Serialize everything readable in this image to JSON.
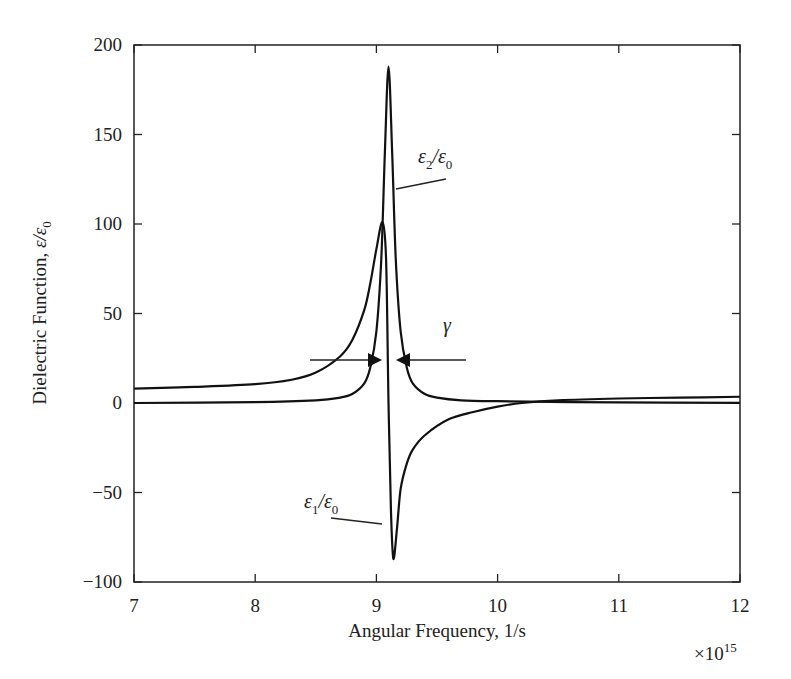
{
  "chart_data": {
    "type": "line",
    "title": "",
    "xlabel": "Angular Frequency, 1/s",
    "ylabel": "Dielectric Function, ε/ε0",
    "x_multiplier_label": "×10^15",
    "xlim": [
      7,
      12
    ],
    "ylim": [
      -100,
      200
    ],
    "xticks": [
      7,
      8,
      9,
      10,
      11,
      12
    ],
    "yticks": [
      -100,
      -50,
      0,
      50,
      100,
      150,
      200
    ],
    "ytick_labels": [
      "−100",
      "−50",
      "0",
      "50",
      "100",
      "150",
      "200"
    ],
    "grid": false,
    "legend": null,
    "series": [
      {
        "name": "ε1/ε0",
        "x": [
          7,
          7.5,
          8,
          8.3,
          8.5,
          8.7,
          8.8,
          8.9,
          8.95,
          9.0,
          9.05,
          9.08,
          9.1,
          9.12,
          9.14,
          9.17,
          9.2,
          9.25,
          9.3,
          9.4,
          9.6,
          9.8,
          10.0,
          10.2,
          10.5,
          11,
          11.5,
          12
        ],
        "y": [
          8,
          9,
          10.5,
          13,
          17,
          26,
          35,
          52,
          67,
          86,
          101,
          80,
          0,
          -60,
          -87,
          -70,
          -48,
          -34,
          -26,
          -18,
          -9,
          -5,
          -2,
          0,
          1.5,
          2.5,
          3,
          3.5
        ]
      },
      {
        "name": "ε2/ε0",
        "x": [
          7,
          8,
          8.5,
          8.7,
          8.8,
          8.9,
          8.95,
          9.0,
          9.04,
          9.07,
          9.1,
          9.13,
          9.16,
          9.2,
          9.25,
          9.3,
          9.4,
          9.5,
          9.7,
          10,
          11,
          12
        ],
        "y": [
          0,
          0.5,
          1.5,
          3,
          5,
          11,
          20,
          40,
          80,
          140,
          188,
          140,
          80,
          40,
          20,
          11,
          5,
          3,
          1.5,
          1,
          0.3,
          0.1
        ]
      }
    ],
    "annotations": [
      {
        "id": "eps2",
        "text_main": "ε",
        "text_sub": "2",
        "text_mid": "/ε",
        "text_sub2": "0",
        "label": "ε2/ε0"
      },
      {
        "id": "eps1",
        "text_main": "ε",
        "text_sub": "1",
        "text_mid": "/ε",
        "text_sub2": "0",
        "label": "ε1/ε0"
      },
      {
        "id": "gamma",
        "label": "γ",
        "description": "linewidth (FWHM) indicated by opposing arrows"
      }
    ]
  },
  "axes": {
    "xlabel": "Angular Frequency, 1/s",
    "ylabel_prefix": "Dielectric Function, ",
    "ylabel_eps": "ε/ε",
    "ylabel_sub": "0",
    "multiplier_base": "×10",
    "multiplier_exp": "15"
  },
  "labels": {
    "gamma": "γ"
  }
}
